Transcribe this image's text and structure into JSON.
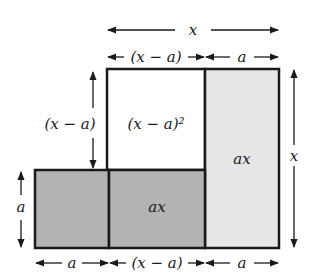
{
  "diagram": {
    "colors": {
      "stroke": "#1a1a1a",
      "dark_fill": "#b3b3b3",
      "light_fill": "#e6e6e6",
      "white_fill": "#ffffff"
    },
    "regions": [
      {
        "id": "square-x-minus-a",
        "label": "(x − a)²",
        "fill": "white"
      },
      {
        "id": "right-strip",
        "label": "ax",
        "fill": "light"
      },
      {
        "id": "bottom-middle",
        "label": "ax",
        "fill": "dark"
      },
      {
        "id": "bottom-left",
        "label": "",
        "fill": "dark"
      }
    ],
    "dimensions": {
      "top_total": "x",
      "top_left": "(x − a)",
      "top_right": "a",
      "left_upper": "(x − a)",
      "left_lower": "a",
      "right_total": "x",
      "bottom_left": "a",
      "bottom_middle": "(x − a)",
      "bottom_right": "a"
    }
  }
}
